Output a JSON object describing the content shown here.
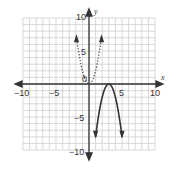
{
  "chart_data": {
    "type": "line",
    "title": "",
    "xlabel": "x",
    "ylabel": "y",
    "xlim": [
      -10,
      10
    ],
    "ylim": [
      -10,
      10
    ],
    "grid": true,
    "x_ticks": [
      -10,
      -5,
      5,
      10
    ],
    "y_ticks": [
      10,
      5,
      -5,
      -10
    ],
    "origin_label": "0",
    "series": [
      {
        "name": "dotted parabola (parent)",
        "style": "dotted",
        "equation": "y = 2x^2",
        "vertex": [
          0,
          0
        ],
        "x": [
          -1.9,
          -1.5,
          -1,
          -0.5,
          0,
          0.5,
          1,
          1.5,
          1.9
        ],
        "y": [
          7.2,
          4.5,
          2,
          0.5,
          0,
          0.5,
          2,
          4.5,
          7.2
        ]
      },
      {
        "name": "solid parabola (transformed)",
        "style": "solid",
        "equation": "y = -2(x-3)^2",
        "vertex": [
          3,
          0
        ],
        "x": [
          1,
          1.5,
          2,
          2.5,
          3,
          3.5,
          4,
          4.5,
          5
        ],
        "y": [
          -8,
          -4.5,
          -2,
          -0.5,
          0,
          -0.5,
          -2,
          -4.5,
          -8
        ]
      }
    ]
  },
  "labels": {
    "x_axis": "x",
    "y_axis": "y",
    "origin": "0",
    "xt_m10": "−10",
    "xt_m5": "−5",
    "xt_5": "5",
    "xt_10": "10",
    "yt_10": "10",
    "yt_5": "5",
    "yt_m5": "−5",
    "yt_m10": "−10"
  }
}
